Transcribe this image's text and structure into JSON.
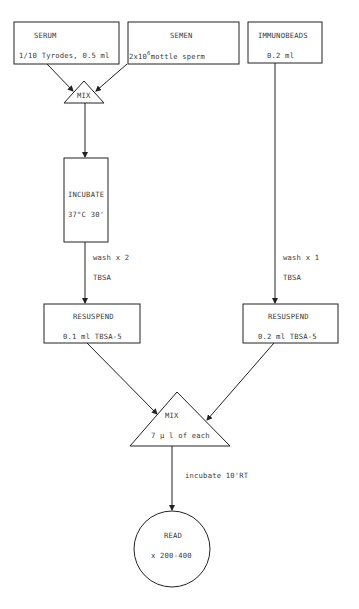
{
  "diagram": {
    "nodes": {
      "serum": {
        "title": "SERUM",
        "detail": "1/10 Tyrodes, 0.5 ml"
      },
      "semen": {
        "title": "SEMEN",
        "detail_prefix": "2x10",
        "detail_exp": "6",
        "detail_suffix": "mottle sperm"
      },
      "immunobeads": {
        "title": "IMMUNOBEADS",
        "detail": "0.2 ml"
      },
      "mix1": {
        "title": "MIX"
      },
      "incubate": {
        "title": "INCUBATE",
        "detail": "37°C 30'"
      },
      "resuspend_left": {
        "title": "RESUSPEND",
        "detail": "0.1 ml TBSA-5"
      },
      "resuspend_right": {
        "title": "RESUSPEND",
        "detail": "0.2 ml TBSA-5"
      },
      "mix2": {
        "title": "MIX",
        "detail": "7 µ l of each"
      },
      "read": {
        "title": "READ",
        "detail": "x 200-400"
      }
    },
    "edge_labels": {
      "incubate_to_resuspend": {
        "line1": "wash x 2",
        "line2": "TBSA"
      },
      "beads_to_resuspend": {
        "line1": "wash x 1",
        "line2": "TBSA"
      },
      "mix_to_read": {
        "line1": "incubate 10'RT"
      }
    },
    "colors": {
      "stroke": "#222222",
      "text": "#3a3a3a",
      "background": "#ffffff"
    }
  }
}
